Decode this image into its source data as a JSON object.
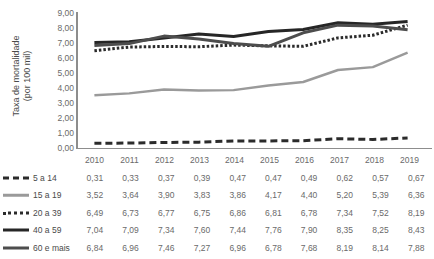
{
  "chart_data": {
    "type": "line",
    "title": "",
    "xlabel": "",
    "ylabel_line1": "Taxa de mortalidade",
    "ylabel_line2": "(por 100 mil)",
    "categories": [
      "2010",
      "2011",
      "2012",
      "2013",
      "2014",
      "2015",
      "2016",
      "2017",
      "2018",
      "2019"
    ],
    "ylim": [
      0,
      9
    ],
    "ytick_labels": [
      "0,00",
      "1,00",
      "2,00",
      "3,00",
      "4,00",
      "5,00",
      "6,00",
      "7,00",
      "8,00",
      "9,00"
    ],
    "ytick_values": [
      0,
      1,
      2,
      3,
      4,
      5,
      6,
      7,
      8,
      9
    ],
    "grid": false,
    "legend_position": "table-left",
    "series": [
      {
        "name": "5 a 14",
        "style": "dashed",
        "color": "#2b2b2b",
        "values": [
          0.31,
          0.33,
          0.37,
          0.39,
          0.47,
          0.47,
          0.49,
          0.62,
          0.57,
          0.67
        ],
        "labels": [
          "0,31",
          "0,33",
          "0,37",
          "0,39",
          "0,47",
          "0,47",
          "0,49",
          "0,62",
          "0,57",
          "0,67"
        ]
      },
      {
        "name": "15 a 19",
        "style": "solid-gray",
        "color": "#9a9a9a",
        "values": [
          3.52,
          3.64,
          3.9,
          3.83,
          3.86,
          4.17,
          4.4,
          5.2,
          5.39,
          6.36
        ],
        "labels": [
          "3,52",
          "3,64",
          "3,90",
          "3,83",
          "3,86",
          "4,17",
          "4,40",
          "5,20",
          "5,39",
          "6,36"
        ]
      },
      {
        "name": "20 a 39",
        "style": "dotted",
        "color": "#2b2b2b",
        "values": [
          6.49,
          6.73,
          6.77,
          6.75,
          6.86,
          6.81,
          6.78,
          7.34,
          7.52,
          8.19
        ],
        "labels": [
          "6,49",
          "6,73",
          "6,77",
          "6,75",
          "6,86",
          "6,81",
          "6,78",
          "7,34",
          "7,52",
          "8,19"
        ]
      },
      {
        "name": "40 a 59",
        "style": "solid-black",
        "color": "#262626",
        "values": [
          7.04,
          7.09,
          7.34,
          7.6,
          7.44,
          7.76,
          7.9,
          8.35,
          8.25,
          8.43
        ],
        "labels": [
          "7,04",
          "7,09",
          "7,34",
          "7,60",
          "7,44",
          "7,76",
          "7,90",
          "8,35",
          "8,25",
          "8,43"
        ]
      },
      {
        "name": "60 e mais",
        "style": "solid-dark",
        "color": "#4d4d4d",
        "values": [
          6.84,
          6.96,
          7.46,
          7.27,
          6.96,
          6.78,
          7.68,
          8.19,
          8.14,
          7.88
        ],
        "labels": [
          "6,84",
          "6,96",
          "7,46",
          "7,27",
          "6,96",
          "6,78",
          "7,68",
          "8,19",
          "8,14",
          "7,88"
        ]
      }
    ]
  }
}
